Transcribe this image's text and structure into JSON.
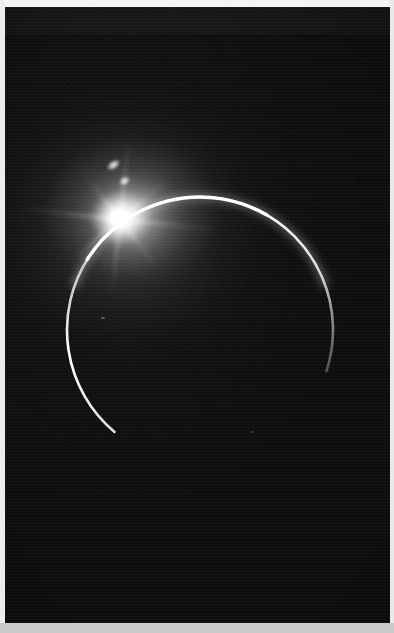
{
  "image": {
    "subject": "solar-eclipse-crescent",
    "description": "Dark night sky photograph showing a thin bright crescent limb of a planetary body with an intense burst of sunlight emerging at its upper-left edge",
    "width_px": 394,
    "height_px": 633,
    "orientation": "portrait"
  },
  "colors": {
    "sky_black": "#0b0b0c",
    "sky_upper_band": "#131314",
    "limb_white": "#ffffff",
    "glow_white": "#f8f8f8",
    "paper_margin_top": "#f4f4f4",
    "paper_margin_left": "#ececec",
    "paper_margin_right": "#e9e9e9",
    "paper_margin_bottom": "#c9c9c9"
  },
  "layout": {
    "plate": {
      "left": 5,
      "top": 7,
      "width": 385,
      "height": 616
    },
    "margins": {
      "top_height": 7,
      "left_width": 5,
      "right_width": 4,
      "bottom_height": 10
    },
    "seam_y": 33
  },
  "features": {
    "sun_burst": {
      "label": "sun-burst",
      "center_x": 120,
      "center_y": 218,
      "core_radius_px": 10,
      "burst_radius_px": 32
    },
    "crescent": {
      "label": "crescent-limb",
      "center_x": 200,
      "center_y": 330,
      "radius_px": 133,
      "stroke_px": 2.4,
      "arc_start_deg": 155,
      "arc_end_deg": 335,
      "fade_right_deg": 45,
      "fade_left_deg": 120
    },
    "corona": {
      "label": "corona-glow",
      "extent_px": 230,
      "brightest_toward": "lower-right interior"
    },
    "diffraction_spikes": {
      "label": "diffraction-spikes",
      "count": 8,
      "angles_deg": [
        6,
        52,
        96,
        140,
        186,
        232,
        276,
        320
      ],
      "lengths_px": [
        96,
        62,
        78,
        70,
        104,
        58,
        84,
        66
      ]
    },
    "lens_flares": [
      {
        "label": "flare-spot-1",
        "x": 113,
        "y": 165,
        "w": 17,
        "h": 10,
        "rotation_deg": -34
      },
      {
        "label": "flare-spot-2",
        "x": 124,
        "y": 181,
        "w": 13,
        "h": 10,
        "rotation_deg": -30
      }
    ],
    "dust_specks": [
      {
        "label": "dust-speck-1",
        "x": 101,
        "y": 317
      },
      {
        "label": "dust-speck-2",
        "x": 251,
        "y": 431
      }
    ]
  }
}
